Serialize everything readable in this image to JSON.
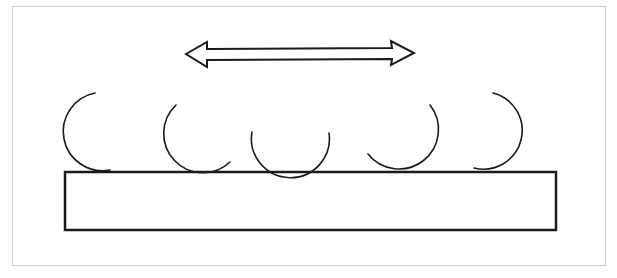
{
  "diagram": {
    "colors": {
      "stroke": "#1a1a1a",
      "frame": "#cfcfcf",
      "background": "#ffffff"
    },
    "arrow": {
      "type": "double-headed-horizontal",
      "x1": 186,
      "x2": 414,
      "y": 54
    },
    "base": {
      "x": 65,
      "y": 172,
      "width": 491,
      "height": 58
    },
    "arcs": [
      {
        "cx": 100,
        "cy": 133,
        "r": 39,
        "opening": "right"
      },
      {
        "cx": 203,
        "cy": 133,
        "r": 39,
        "opening": "upper-right"
      },
      {
        "cx": 289,
        "cy": 133,
        "r": 39,
        "opening": "top"
      },
      {
        "cx": 398,
        "cy": 131,
        "r": 39,
        "opening": "upper-left"
      },
      {
        "cx": 484,
        "cy": 131,
        "r": 38,
        "opening": "left"
      }
    ]
  }
}
